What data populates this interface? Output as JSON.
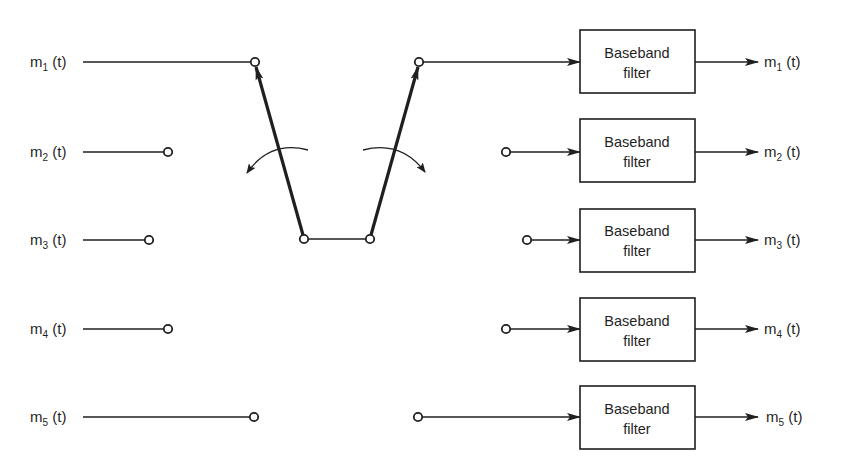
{
  "diagram": {
    "title": "",
    "type": "TDM commutator / decommutator block diagram",
    "colors": {
      "line": "#1f1f1f",
      "background": "#ffffff"
    },
    "inputs": [
      {
        "base": "m",
        "sub": "1",
        "arg": " (t)"
      },
      {
        "base": "m",
        "sub": "2",
        "arg": " (t)"
      },
      {
        "base": "m",
        "sub": "3",
        "arg": " (t)"
      },
      {
        "base": "m",
        "sub": "4",
        "arg": " (t)"
      },
      {
        "base": "m",
        "sub": "5",
        "arg": " (t)"
      }
    ],
    "filters": [
      {
        "line1": "Baseband",
        "line2": "filter"
      },
      {
        "line1": "Baseband",
        "line2": "filter"
      },
      {
        "line1": "Baseband",
        "line2": "filter"
      },
      {
        "line1": "Baseband",
        "line2": "filter"
      },
      {
        "line1": "Baseband",
        "line2": "filter"
      }
    ],
    "outputs": [
      {
        "base": "m",
        "sub": "1",
        "arg": " (t)"
      },
      {
        "base": "m",
        "sub": "2",
        "arg": " (t)"
      },
      {
        "base": "m",
        "sub": "3",
        "arg": " (t)"
      },
      {
        "base": "m",
        "sub": "4",
        "arg": " (t)"
      },
      {
        "base": "m",
        "sub": "5",
        "arg": " (t)"
      }
    ],
    "commutator": {
      "name": "transmit-commutator",
      "rotation": "counter-clockwise",
      "connected_channel": 1
    },
    "decommutator": {
      "name": "receive-decommutator",
      "rotation": "clockwise",
      "connected_channel": 1
    }
  }
}
